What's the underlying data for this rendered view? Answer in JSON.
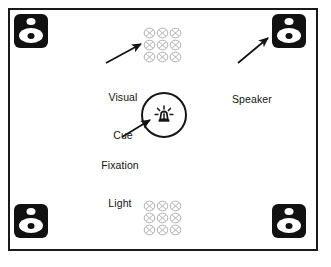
{
  "figure": {
    "type": "experimental-apparatus-diagram",
    "background_color": "#ffffff",
    "frame_color": "#1a1a1a"
  },
  "labels": {
    "visual_cue": {
      "line1": "Visual",
      "line2": "Cue"
    },
    "speaker": {
      "line1": "Speaker"
    },
    "fixation_light": {
      "line1": "Fixation",
      "line2": "Light"
    }
  },
  "elements": {
    "speakers": [
      {
        "id": "speaker-top-left",
        "position": "top-left",
        "icon": "speaker-icon"
      },
      {
        "id": "speaker-top-right",
        "position": "top-right",
        "icon": "speaker-icon"
      },
      {
        "id": "speaker-bottom-left",
        "position": "bottom-left",
        "icon": "speaker-icon"
      },
      {
        "id": "speaker-bottom-right",
        "position": "bottom-right",
        "icon": "speaker-icon"
      }
    ],
    "visual_cues": [
      {
        "id": "cue-grid-top",
        "position": "top-center",
        "rows": 3,
        "cols": 3,
        "symbol": "circled-x",
        "color": "#b4b4b4"
      },
      {
        "id": "cue-grid-bottom",
        "position": "bottom-center",
        "rows": 3,
        "cols": 3,
        "symbol": "circled-x",
        "color": "#b4b4b4"
      }
    ],
    "fixation_light": {
      "id": "fixation-light",
      "position": "center",
      "icon": "beacon-lamp-icon",
      "shape": "circle"
    }
  },
  "annotations": [
    {
      "id": "arrow-visual-cue",
      "from": "visual-cue-label",
      "to": "cue-grid-top"
    },
    {
      "id": "arrow-speaker",
      "from": "speaker-label",
      "to": "speaker-top-right"
    },
    {
      "id": "arrow-fixation-light",
      "from": "fixation-light-label",
      "to": "fixation-light"
    }
  ]
}
